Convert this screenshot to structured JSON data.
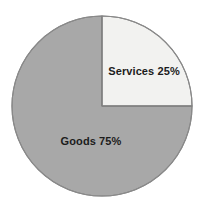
{
  "chart_data": {
    "type": "pie",
    "title": "",
    "subtitle": "",
    "xlabel": "",
    "ylabel": "",
    "grid": false,
    "legend_position": "none",
    "label_mode": "inside-slice",
    "total": 100,
    "units": "%",
    "start_angle_deg": 0,
    "direction": "clockwise",
    "categories": [
      "Services",
      "Goods"
    ],
    "values": [
      25,
      75
    ],
    "slices": [
      {
        "name": "Services",
        "value": 25,
        "label": "Services 25%",
        "color": "#f2f2f0",
        "start_angle_deg": 0,
        "end_angle_deg": 90
      },
      {
        "name": "Goods",
        "value": 75,
        "label": "Goods 75%",
        "color": "#a8a8a8",
        "start_angle_deg": 90,
        "end_angle_deg": 360
      }
    ],
    "annotations": [],
    "colors": {
      "background": "#ffffff",
      "outline": "#808080",
      "divider": "#808080",
      "label_text": "#1c1c1c",
      "services_fill": "#f2f2f0",
      "goods_fill": "#a8a8a8"
    },
    "geometry": {
      "center_x": 102,
      "center_y": 106,
      "radius": 90
    }
  }
}
